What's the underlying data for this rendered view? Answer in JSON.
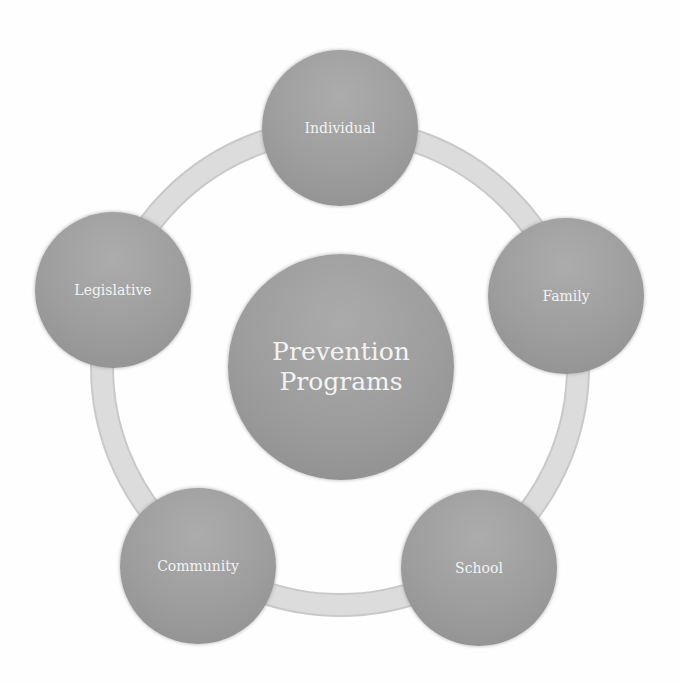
{
  "diagram": {
    "type": "radial-cycle",
    "center": {
      "line1": "Prevention",
      "line2": "Programs"
    },
    "nodes": [
      {
        "label": "Individual"
      },
      {
        "label": "Family"
      },
      {
        "label": "School"
      },
      {
        "label": "Community"
      },
      {
        "label": "Legislative"
      }
    ],
    "colors": {
      "node_fill_top": "#acacac",
      "node_fill_bottom": "#8e8e8e",
      "ring": "#d9d9d9",
      "text": "#f3f3f3",
      "background": "#ffffff"
    }
  }
}
